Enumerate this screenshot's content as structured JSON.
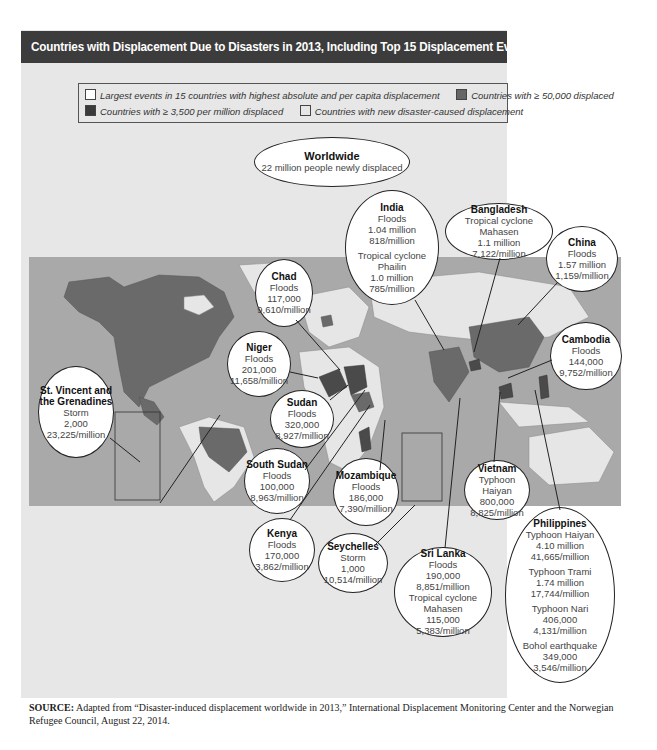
{
  "title": "Countries with Displacement Due to Disasters in 2013, Including Top 15 Displacement Events",
  "legend": {
    "items": [
      {
        "label": "Largest events in 15 countries with highest absolute and per capita displacement",
        "color": "#ffffff"
      },
      {
        "label": "Countries with ≥ 50,000 displaced",
        "color": "#666666"
      },
      {
        "label": "Countries with ≥ 3,500 per million displaced",
        "color": "#3a3a3a"
      },
      {
        "label": "Countries with new disaster-caused displacement",
        "color": "#e6e6e6"
      }
    ]
  },
  "worldwide": {
    "title": "Worldwide",
    "text": "22 million people newly displaced"
  },
  "callouts": {
    "india": {
      "name": "India",
      "e1": "Floods",
      "v1": "1.04 million",
      "r1": "818/million",
      "e2": "Tropical cyclone Phailin",
      "v2": "1.0 million",
      "r2": "785/million"
    },
    "bangladesh": {
      "name": "Bangladesh",
      "e1": "Tropical cyclone Mahasen",
      "v1": "1.1 million",
      "r1": "7,122/million"
    },
    "china": {
      "name": "China",
      "e1": "Floods",
      "v1": "1.57 million",
      "r1": "1,159/million"
    },
    "chad": {
      "name": "Chad",
      "e1": "Floods",
      "v1": "117,000",
      "r1": "9,610/million"
    },
    "niger": {
      "name": "Niger",
      "e1": "Floods",
      "v1": "201,000",
      "r1": "11,658/million"
    },
    "cambodia": {
      "name": "Cambodia",
      "e1": "Floods",
      "v1": "144,000",
      "r1": "9,752/million"
    },
    "stvincent": {
      "name1": "St. Vincent and",
      "name2": "the Grenadines",
      "e1": "Storm",
      "v1": "2,000",
      "r1": "23,225/million"
    },
    "sudan": {
      "name": "Sudan",
      "e1": "Floods",
      "v1": "320,000",
      "r1": "8,927/million"
    },
    "southsudan": {
      "name": "South Sudan",
      "e1": "Floods",
      "v1": "100,000",
      "r1": "8,963/million"
    },
    "mozambique": {
      "name": "Mozambique",
      "e1": "Floods",
      "v1": "186,000",
      "r1": "7,390/million"
    },
    "vietnam": {
      "name": "Vietnam",
      "e1": "Typhoon Haiyan",
      "v1": "800,000",
      "r1": "8,825/million"
    },
    "kenya": {
      "name": "Kenya",
      "e1": "Floods",
      "v1": "170,000",
      "r1": "3,862/million"
    },
    "seychelles": {
      "name": "Seychelles",
      "e1": "Storm",
      "v1": "1,000",
      "r1": "10,514/million"
    },
    "srilanka": {
      "name": "Sri Lanka",
      "e1": "Floods",
      "v1": "190,000",
      "r1": "8,851/million",
      "e2": "Tropical cyclone Mahasen",
      "v2": "115,000",
      "r2": "5,383/million"
    },
    "philippines": {
      "name": "Philippines",
      "e1": "Typhoon Haiyan",
      "v1": "4.10 million",
      "r1": "41,665/million",
      "e2": "Typhoon Trami",
      "v2": "1.74 million",
      "r2": "17,744/million",
      "e3": "Typhoon Nari",
      "v3": "406,000",
      "r3": "4,131/million",
      "e4": "Bohol earthquake",
      "v4": "349,000",
      "r4": "3,546/million"
    }
  },
  "source": {
    "label": "SOURCE:",
    "text": " Adapted from “Disaster-induced displacement worldwide in 2013,” International Displacement Monitoring Center and the Norwegian Refugee Council, August 22, 2014."
  }
}
